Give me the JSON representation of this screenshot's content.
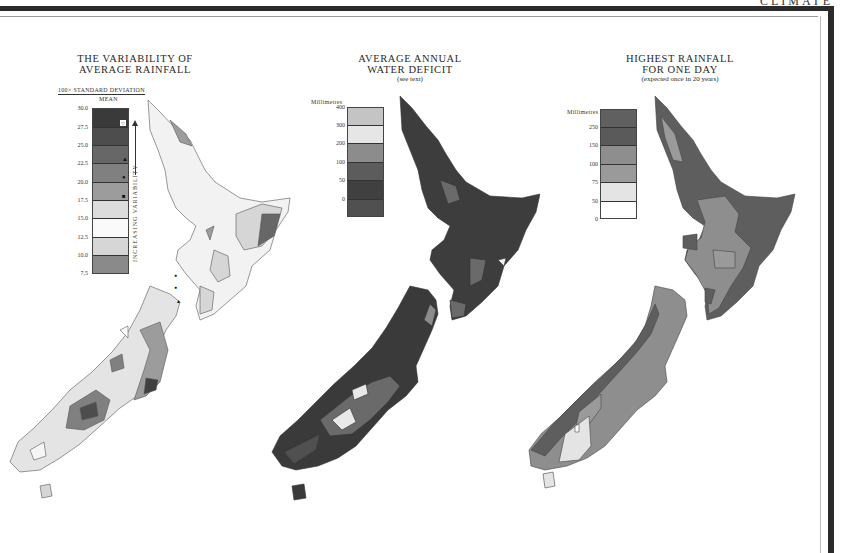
{
  "header": {
    "section_tag": "CLIMATE"
  },
  "maps": [
    {
      "id": "variability",
      "title_line1": "THE VARIABILITY OF",
      "title_line2": "AVERAGE RAINFALL",
      "legend": {
        "header_top": "100× STANDARD DEVIATION",
        "header_bottom": "MEAN",
        "side_label": "INCREASING VARIABILITY",
        "ticks": [
          "30.0",
          "27.5",
          "25.0",
          "22.5",
          "20.0",
          "17.5",
          "15.0",
          "12.5",
          "10.0",
          "7.5"
        ],
        "colors": [
          "#3a3a3a",
          "#4d4d4d",
          "#676767",
          "#808080",
          "#9c9c9c",
          "#dcdcdc",
          "#fafafa",
          "#d6d6d6",
          "#8a8a8a"
        ],
        "markers": [
          "open-circle",
          "triangle",
          "dot",
          "square"
        ]
      }
    },
    {
      "id": "water-deficit",
      "title_line1": "AVERAGE ANNUAL",
      "title_line2": "WATER DEFICIT",
      "subtitle": "(see text)",
      "legend": {
        "unit": "Millimetres",
        "ticks": [
          "400",
          "300",
          "200",
          "100",
          "50",
          "0"
        ],
        "colors": [
          "#c4c4c4",
          "#e6e6e6",
          "#8c8c8c",
          "#5c5c5c",
          "#404040",
          "#505050"
        ]
      }
    },
    {
      "id": "highest-rainfall",
      "title_line1": "HIGHEST RAINFALL",
      "title_line2": "FOR ONE DAY",
      "subtitle": "(expected once in 20 years)",
      "legend": {
        "unit": "Millimetres",
        "ticks": [
          "250",
          "150",
          "100",
          "75",
          "50",
          "0"
        ],
        "colors": [
          "#606060",
          "#5a5a5a",
          "#8e8e8e",
          "#9a9a9a",
          "#e4e4e4",
          "#ffffff"
        ]
      }
    }
  ]
}
